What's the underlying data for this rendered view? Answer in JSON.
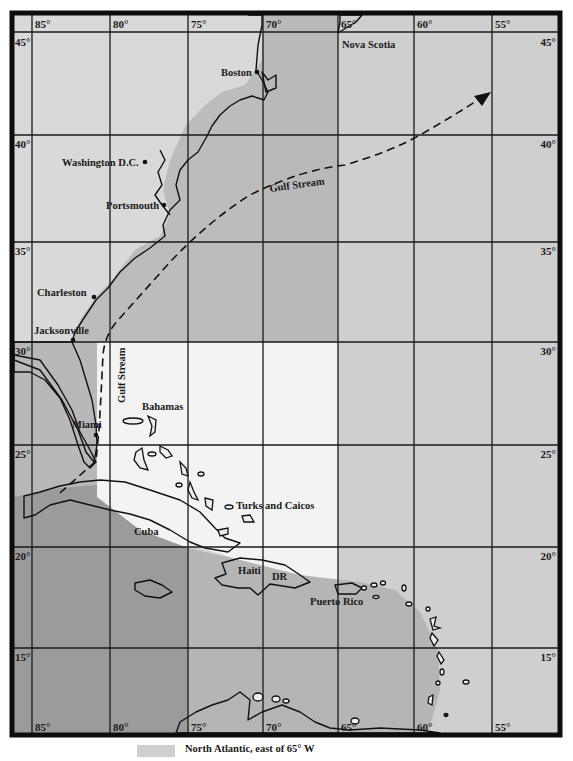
{
  "map": {
    "title": "",
    "colors": {
      "frame": "#0d0d0d",
      "land": "#d8d8d8",
      "zone_north_east": "#cbcbcb",
      "zone_coastal_shelf": "#b9b9b9",
      "zone_bahamas": "#f2f2f2",
      "zone_gulf": "#b4b4b4",
      "zone_caribbean_west": "#9a9a9a",
      "zone_caribbean_east": "#b6b6b6",
      "zone_atlantic_east": "#cfcfcf",
      "grid": "#1a1a1a"
    },
    "longitude_labels_top": [
      "85°",
      "80°",
      "75°",
      "70°",
      "65°",
      "60°",
      "55°"
    ],
    "longitude_labels_bottom": [
      "85°",
      "80°",
      "75°",
      "70°",
      "65°",
      "60°",
      "55°"
    ],
    "latitude_labels_left": [
      "45°",
      "40°",
      "35°",
      "30°",
      "25°",
      "20°",
      "15°"
    ],
    "latitude_labels_right": [
      "45°",
      "40°",
      "35°",
      "30°",
      "25°",
      "20°",
      "15°"
    ],
    "cities": [
      {
        "name": "Boston",
        "icon": "city-dot-icon"
      },
      {
        "name": "Washington D.C.",
        "icon": "city-dot-icon"
      },
      {
        "name": "Portsmouth",
        "icon": "city-dot-icon"
      },
      {
        "name": "Charleston",
        "icon": "city-dot-icon"
      },
      {
        "name": "Jacksonville",
        "icon": "city-dot-icon"
      },
      {
        "name": "Miami",
        "icon": "city-dot-icon"
      }
    ],
    "regions": [
      {
        "name": "Nova Scotia"
      },
      {
        "name": "Bahamas"
      },
      {
        "name": "Turks and Caicos"
      },
      {
        "name": "Cuba"
      },
      {
        "name": "Haiti"
      },
      {
        "name": "DR"
      },
      {
        "name": "Puerto Rico"
      }
    ],
    "currents": [
      {
        "name": "Gulf Stream",
        "orientation": "horizontal",
        "icon": "arrow-head-icon"
      },
      {
        "name": "Gulf Stream",
        "orientation": "vertical"
      }
    ],
    "legend": [
      {
        "label": "North Atlantic, east of 65° W",
        "swatch_color": "#cfcfcf"
      }
    ]
  }
}
